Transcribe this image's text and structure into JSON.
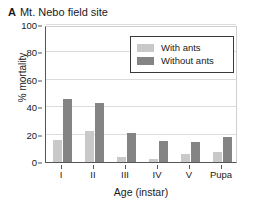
{
  "figure": {
    "panel_letter": "A",
    "title": "Mt. Nebo field site"
  },
  "axes": {
    "ylabel": "% mortality",
    "xlabel": "Age (instar)",
    "yticks": [
      "0",
      "20",
      "40",
      "60",
      "80",
      "100"
    ]
  },
  "legend": {
    "items": [
      {
        "label": "With ants",
        "color": "#c9c9c9"
      },
      {
        "label": "Without ants",
        "color": "#848484"
      }
    ]
  },
  "chart_data": {
    "type": "bar",
    "title": "Mt. Nebo field site",
    "xlabel": "Age (instar)",
    "ylabel": "% mortality",
    "ylim": [
      0,
      100
    ],
    "yticks": [
      0,
      20,
      40,
      60,
      80,
      100
    ],
    "grid": true,
    "legend_position": "top-right",
    "categories": [
      "I",
      "II",
      "III",
      "IV",
      "V",
      "Pupa"
    ],
    "series": [
      {
        "name": "With ants",
        "color": "#c9c9c9",
        "values": [
          16,
          22.5,
          4,
          2,
          5.5,
          7
        ]
      },
      {
        "name": "Without ants",
        "color": "#848484",
        "values": [
          46,
          43,
          21,
          15.5,
          14.5,
          18
        ]
      }
    ]
  }
}
